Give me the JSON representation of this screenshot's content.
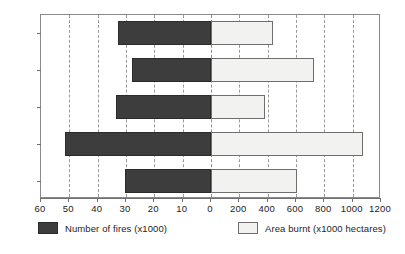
{
  "chart_data": {
    "type": "bar",
    "orientation": "horizontal-bidirectional",
    "title": "",
    "subtitle": "",
    "xlabel": "",
    "ylabel": "",
    "grid": true,
    "legend_position": "bottom",
    "categories": [
      "1982",
      "1983",
      "1984",
      "1985",
      "1986"
    ],
    "series": [
      {
        "name": "Number of fires (x1000)",
        "direction": "left",
        "color": "#3d3d3d",
        "axis_range": [
          0,
          60
        ],
        "axis_ticks": [
          60,
          50,
          40,
          30,
          20,
          10,
          0
        ],
        "values": [
          33,
          28,
          33.5,
          51.5,
          30.5
        ]
      },
      {
        "name": "Area burnt (x1000 hectares)",
        "direction": "right",
        "color": "#f2f2f0",
        "axis_range": [
          0,
          1200
        ],
        "axis_ticks": [
          0,
          200,
          400,
          600,
          800,
          1000,
          1200
        ],
        "values": [
          440,
          730,
          380,
          1070,
          605
        ]
      }
    ],
    "axis_tick_labels": [
      "60",
      "50",
      "40",
      "30",
      "20",
      "10",
      "0",
      "200",
      "400",
      "600",
      "800",
      "1000",
      "1200"
    ]
  },
  "legend": {
    "entries": [
      {
        "label": "Number of fires (x1000)",
        "swatch": "fires"
      },
      {
        "label": "Area burnt (x1000 hectares)",
        "swatch": "area"
      }
    ]
  }
}
